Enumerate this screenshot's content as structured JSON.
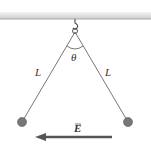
{
  "diagram": {
    "labels": {
      "left_string": "L",
      "right_string": "L",
      "angle": "θ",
      "field": "E"
    },
    "colors": {
      "ceiling": "#d9d9d9",
      "string": "#555555",
      "ball": "#777777",
      "arrow": "#555555"
    }
  }
}
